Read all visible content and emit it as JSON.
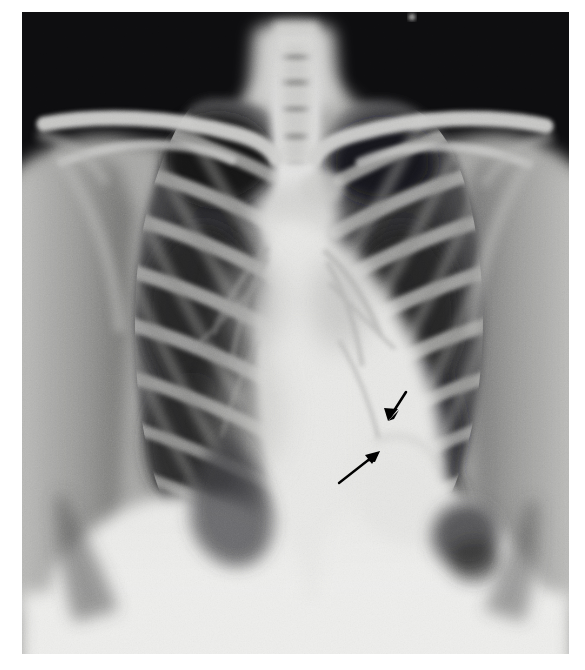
{
  "image": {
    "modality": "chest-radiograph",
    "view": "PA frontal chest X-ray",
    "frame": {
      "x": 22,
      "y": 12,
      "width": 547,
      "height": 649
    },
    "background_color": "#ffffff",
    "border_color": "#ffffff"
  },
  "tones": {
    "air_black": "#0d0d0f",
    "lung_dark": "#2a2a2c",
    "lung_mid": "#4a4a4c",
    "soft_tissue": "#8e8e8e",
    "bone_light": "#c9c9c9",
    "mediastinum_white": "#e6e6e4",
    "diaphragm_white": "#ececea",
    "annotation_black": "#000000"
  },
  "annotations": {
    "arrow_count": 2,
    "arrows": [
      {
        "name": "short-arrow",
        "label": "short arrow pointing down-left",
        "direction": "down-left",
        "tail": {
          "x": 406,
          "y": 392
        },
        "tip": {
          "x": 388,
          "y": 419
        },
        "length_px": 32,
        "color": "#000000"
      },
      {
        "name": "long-arrow",
        "label": "long arrow pointing up-right",
        "direction": "up-right",
        "tail": {
          "x": 339,
          "y": 483
        },
        "tip": {
          "x": 379,
          "y": 452
        },
        "length_px": 51,
        "color": "#000000"
      }
    ],
    "target_region": "left cardiac/diaphragmatic border"
  },
  "anatomy": {
    "structures": [
      "lung apices",
      "clavicles",
      "trachea",
      "ribs",
      "cardiac silhouette",
      "mediastinum",
      "left hemidiaphragm",
      "right hemidiaphragm",
      "costophrenic angles",
      "scapulae",
      "gastric bubble"
    ],
    "rib_pairs_visible": 10,
    "marker_dot": {
      "x": 412,
      "y": 17,
      "label": "bright-marker-dot"
    }
  }
}
